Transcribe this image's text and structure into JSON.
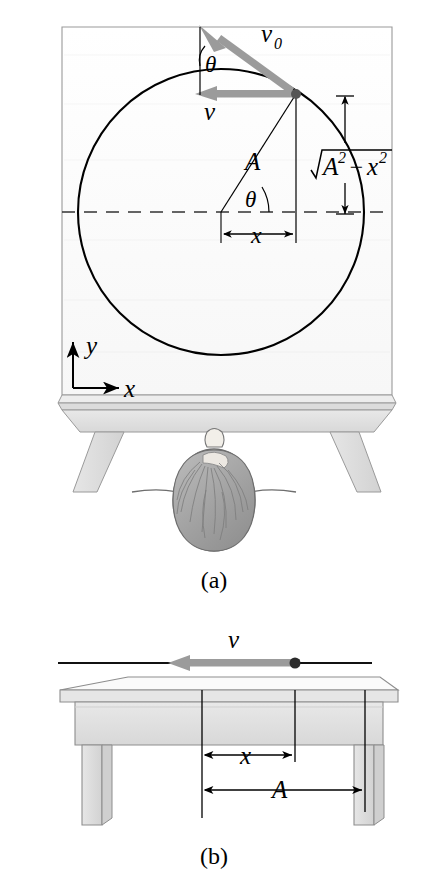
{
  "figure": {
    "panels": [
      {
        "id": "a",
        "caption": "(a)",
        "view": "top-down view of table with circular path",
        "labels": {
          "v0": "v",
          "v0_sub": "0",
          "v": "v",
          "theta_top": "θ",
          "theta_center": "θ",
          "radius": "A",
          "x_dimension": "x",
          "vertical_dimension": "A² − x²",
          "vertical_dimension_radical": "√",
          "axis_y": "y",
          "axis_x": "x"
        },
        "geometry": {
          "circle_center_x": 221,
          "circle_center_y": 212,
          "circle_radius": 143,
          "particle_x": 296,
          "particle_y": 94,
          "theta_degrees": 34
        }
      },
      {
        "id": "b",
        "caption": "(b)",
        "view": "side view of table with velocity vector",
        "labels": {
          "v": "v",
          "x_dimension": "x",
          "amplitude_dimension": "A"
        },
        "geometry": {
          "origin_x": 202,
          "particle_x": 295,
          "amplitude_x": 365
        }
      }
    ],
    "colors": {
      "arrow_gray": "#999999",
      "table_surface": "#fbfbfb",
      "table_edge": "#dcdcdc",
      "table_apron": "#e2e2e2",
      "leg_fill": "#e0e0e0",
      "hair_gray": "#a6a6a6",
      "line_black": "#000000",
      "dashed_axis": "#444444"
    }
  }
}
